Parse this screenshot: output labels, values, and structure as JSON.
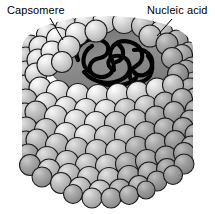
{
  "figure": {
    "background_color": "#ffffff"
  },
  "labels": [
    {
      "id": "capsomere",
      "text": "Capsomere",
      "position": "top-left",
      "leader_line": {
        "from": [
          50,
          18
        ],
        "to": [
          63,
          40
        ]
      }
    },
    {
      "id": "nucleic-acid",
      "text": "Nucleic acid",
      "position": "top-right",
      "leader_line": {
        "from": [
          172,
          19
        ],
        "to": [
          157,
          36
        ]
      }
    }
  ],
  "colors": {
    "capsomere_light": "#cfcfcf",
    "capsomere_mid": "#b6b6b6",
    "capsomere_dark": "#9b9b9b",
    "capsomere_highlight": "#f2f2f2",
    "outline": "#1a1a1a",
    "cavity_gray": "#8c8c8c",
    "nucleic_acid": "#000000",
    "label_text": "#000000",
    "background": "#ffffff"
  },
  "structure": {
    "shape": "cylinder",
    "capsomere_count_visible": 160,
    "rows": 9,
    "cutaway": "open top revealing interior cavity",
    "nucleic_acid_description": "thick coiled black strand looped inside cavity"
  }
}
